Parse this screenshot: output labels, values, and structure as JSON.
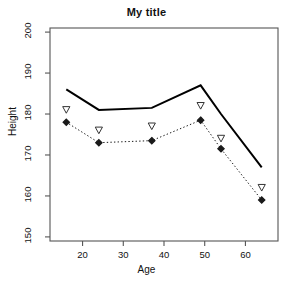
{
  "chart_data": {
    "type": "line",
    "title": "My title",
    "xlabel": "Age",
    "ylabel": "Height",
    "xlim": [
      12,
      68
    ],
    "ylim": [
      149,
      201
    ],
    "xticks": [
      20,
      30,
      40,
      50,
      60
    ],
    "yticks": [
      150,
      160,
      170,
      180,
      190,
      200
    ],
    "grid": false,
    "legend": "none",
    "x": [
      16,
      24,
      37,
      49,
      54,
      64
    ],
    "series": [
      {
        "name": "solid-line",
        "style": "solid",
        "marker": "none",
        "color": "#000000",
        "linewidth": 2,
        "values": [
          186,
          181,
          181.5,
          187,
          180,
          167
        ]
      },
      {
        "name": "dotted-line-diamond",
        "style": "dotted",
        "marker": "filled-diamond",
        "color": "#1a1a1a",
        "linewidth": 1,
        "values": [
          178,
          173,
          173.5,
          178.5,
          171.5,
          159
        ]
      },
      {
        "name": "open-triangle-points",
        "style": "none",
        "marker": "open-triangle-down",
        "color": "#333333",
        "linewidth": 0,
        "values": [
          181,
          176,
          177,
          182,
          174,
          162
        ]
      }
    ]
  },
  "axes": {
    "y_tick_labels": [
      "200",
      "190",
      "180",
      "170",
      "160",
      "150"
    ],
    "x_tick_labels": [
      "20",
      "30",
      "40",
      "50",
      "60"
    ]
  },
  "labels": {
    "title": "My title",
    "x_axis_title": "Age",
    "y_axis_title": "Height"
  }
}
